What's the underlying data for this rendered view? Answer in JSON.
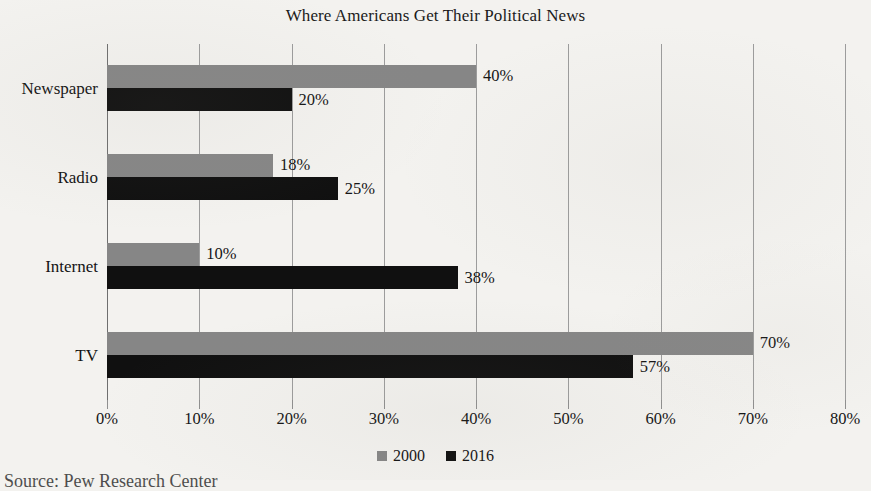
{
  "chart_data": {
    "type": "bar",
    "orientation": "horizontal",
    "title": "Where Americans Get Their Political News",
    "categories": [
      "Newspaper",
      "Radio",
      "Internet",
      "TV"
    ],
    "series": [
      {
        "name": "2000",
        "color": "#868686",
        "values": [
          40,
          18,
          10,
          70
        ],
        "value_labels": [
          "40%",
          "18%",
          "10%",
          "70%"
        ]
      },
      {
        "name": "2016",
        "color": "#101010",
        "values": [
          20,
          25,
          38,
          57
        ],
        "value_labels": [
          "20%",
          "25%",
          "38%",
          "57%"
        ]
      }
    ],
    "xlabel": "",
    "ylabel": "",
    "xlim": [
      0,
      80
    ],
    "xtick_values": [
      0,
      10,
      20,
      30,
      40,
      50,
      60,
      70,
      80
    ],
    "xtick_labels": [
      "0%",
      "10%",
      "20%",
      "30%",
      "40%",
      "50%",
      "60%",
      "70%",
      "80%"
    ],
    "grid": true,
    "legend_position": "bottom"
  },
  "source_note": "Source: Pew Research Center"
}
